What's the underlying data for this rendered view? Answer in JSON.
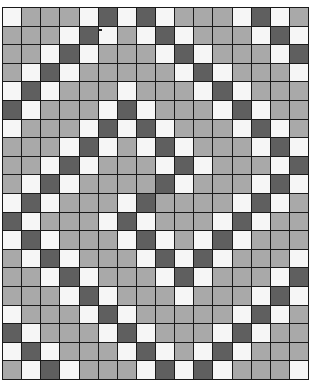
{
  "grid": {
    "columns": 16,
    "rows": 20,
    "legend": {
      "W": "white",
      "G": "gray",
      "D": "dark"
    },
    "colors": {
      "W": "#f6f6f6",
      "G": "#a9a9a9",
      "D": "#5f5f5f",
      "line": "#1a1a1a"
    },
    "cells": [
      "WGGGWDWDWGGGWDWG",
      "GGGWDWGWDWGGGWDW",
      "GGWDWGGGWDWGGGWD",
      "GWDWGGGGGWDWGGGW",
      "WDWGGGWGGGWDWGGG",
      "DWGGGWDWGGGWDWGG",
      "WGGGWDWDWGGGWDWG",
      "GGGWDWGWDWGGGWDW",
      "GGWDWGGGWDWGGGWD",
      "GWDWGGGGDWGGGWDW",
      "WDWGGGWDGGGGWDWG",
      "DWGGGWDWGGGWDWGG",
      "WDWGGGWDWGWDWGGG",
      "GWDWGGGWDWDWGGGW",
      "GGWDWGGGWDWGGGWD",
      "GGGWDWGGGWGGGWDW",
      "WGGGWDWGGGGGWDWG",
      "DWGGGWDWGGGWDWGG",
      "WDWGGGWDWGWDWGGG",
      "GWDWGGGWDWDWGGGW"
    ]
  }
}
